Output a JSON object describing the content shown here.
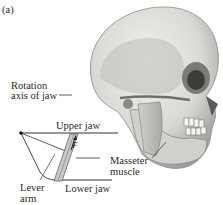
{
  "figure": {
    "panel_label": "(a)",
    "labels": {
      "rotation_line1": "Rotation",
      "rotation_line2": "axis of jaw",
      "upper_jaw": "Upper jaw",
      "lower_jaw": "Lower jaw",
      "masseter_line1": "Masseter",
      "masseter_line2": "muscle",
      "lever_line1": "Lever",
      "lever_line2": "arm",
      "force": "F"
    },
    "illustration": "skull-side-view"
  }
}
